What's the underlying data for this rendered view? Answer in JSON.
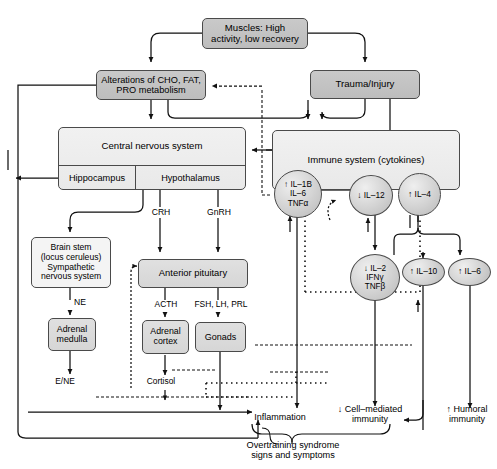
{
  "diagram": {
    "nodes": {
      "muscles": "Muscles: High\nactivity, low recovery",
      "muscles_l1": "Muscles: High",
      "muscles_l2": "activity, low recovery",
      "alterations_l1": "Alterations of CHO, FAT,",
      "alterations_l2": "PRO metabolism",
      "trauma": "Trauma/Injury",
      "cns": "Central nervous system",
      "hippocampus": "Hippocampus",
      "hypothalamus": "Hypothalamus",
      "immune": "Immune system (cytokines)",
      "brainstem_l1": "Brain stem",
      "brainstem_l2": "(locus ceruleus)",
      "brainstem_l3": "Sympathetic",
      "brainstem_l4": "nervous system",
      "anterior_pituitary": "Anterior pituitary",
      "adrenal_medulla_l1": "Adrenal",
      "adrenal_medulla_l2": "medulla",
      "adrenal_cortex_l1": "Adrenal",
      "adrenal_cortex_l2": "cortex",
      "gonads": "Gonads"
    },
    "cytokines": [
      {
        "id": "il1b",
        "l1": "↑ IL–1B",
        "l2": "IL–6",
        "l3": "TNFα"
      },
      {
        "id": "il12",
        "l1": "↓ IL–12"
      },
      {
        "id": "il4",
        "l1": "↑ IL–4"
      },
      {
        "id": "il2",
        "l1": "↓ IL–2",
        "l2": "IFNγ",
        "l3": "TNFβ"
      },
      {
        "id": "il10",
        "l1": "↑ IL–10"
      },
      {
        "id": "il6",
        "l1": "↑ IL–6"
      }
    ],
    "edge_labels": {
      "crh": "CRH",
      "gnrh": "GnRH",
      "ne": "NE",
      "acth": "ACTH",
      "fsh_lh_prl": "FSH, LH, PRL",
      "e_ne": "E/NE",
      "cortisol": "Cortisol"
    },
    "outcomes": {
      "inflammation": "Inflammation",
      "cell_mediated_l1": "↓ Cell–mediated",
      "cell_mediated_l2": "immunity",
      "humoral_l1": "↑ Humoral",
      "humoral_l2": "immunity",
      "overtraining_l1": "Overtraining syndrome",
      "overtraining_l2": "signs and symptoms"
    },
    "colors": {
      "node_dark": "#c3c3c3",
      "node_light": "#ececec",
      "stroke": "#4a4a4a",
      "line": "#1a1a1a",
      "background": "#ffffff"
    }
  }
}
